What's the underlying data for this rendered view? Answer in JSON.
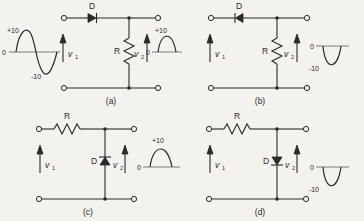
{
  "figure": {
    "labels": {
      "diode": "D",
      "resistor": "R",
      "v_in": "v",
      "v_in_sub": "1",
      "v_out": "v",
      "v_out_sub": "2",
      "zero": "0",
      "plus10": "+10",
      "minus10": "-10"
    }
  },
  "panels": [
    {
      "id": "a",
      "caption": "(a)",
      "topology": "series-diode",
      "diode_label": "D",
      "diode_orientation": "right",
      "resistor_label": "R",
      "resistor_orientation": "vertical",
      "input_label": "v",
      "input_sub": "1",
      "output_label": "v",
      "output_sub": "2",
      "input_wave": {
        "type": "full-sine",
        "peak_label": "+10",
        "trough_label": "-10",
        "zero_label": "0",
        "ymax": 10,
        "ymin": -10
      },
      "output_wave": {
        "type": "positive-half-sine",
        "peak_label": "+10",
        "zero_label": "0",
        "ymax": 10,
        "ymin": 0
      }
    },
    {
      "id": "b",
      "caption": "(b)",
      "topology": "series-diode",
      "diode_label": "D",
      "diode_orientation": "left",
      "resistor_label": "R",
      "resistor_orientation": "vertical",
      "input_label": "v",
      "input_sub": "1",
      "output_label": "v",
      "output_sub": "2",
      "input_wave": null,
      "output_wave": {
        "type": "negative-half-sine",
        "trough_label": "-10",
        "zero_label": "0",
        "ymax": 0,
        "ymin": -10
      }
    },
    {
      "id": "c",
      "caption": "(c)",
      "topology": "shunt-diode",
      "diode_label": "D",
      "diode_orientation": "up",
      "resistor_label": "R",
      "resistor_orientation": "horizontal",
      "input_label": "v",
      "input_sub": "1",
      "output_label": "v",
      "output_sub": "2",
      "input_wave": null,
      "output_wave": {
        "type": "positive-half-sine",
        "peak_label": "+10",
        "zero_label": "0",
        "ymax": 10,
        "ymin": 0
      }
    },
    {
      "id": "d",
      "caption": "(d)",
      "topology": "shunt-diode",
      "diode_label": "D",
      "diode_orientation": "down",
      "resistor_label": "R",
      "resistor_orientation": "horizontal",
      "input_label": "v",
      "input_sub": "1",
      "output_label": "v",
      "output_sub": "2",
      "input_wave": null,
      "output_wave": {
        "type": "negative-half-sine",
        "trough_label": "-10",
        "zero_label": "0",
        "ymax": 0,
        "ymin": -10
      }
    }
  ]
}
